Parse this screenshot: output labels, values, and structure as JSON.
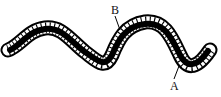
{
  "diagram": {
    "labels": [
      {
        "id": "B",
        "text": "B"
      },
      {
        "id": "A",
        "text": "A"
      }
    ]
  }
}
